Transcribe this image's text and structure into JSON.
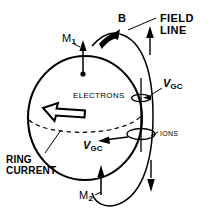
{
  "figure": {
    "background_color": "#ffffff",
    "line_color": "#000000",
    "width": 209,
    "height": 217
  },
  "labels": {
    "field_line_line1": "FIELD",
    "field_line_line2": "LINE",
    "magnetic_field": "B",
    "mirror_point_top_symbol": "M",
    "mirror_point_top_sub": "1",
    "mirror_point_bottom_symbol": "M",
    "mirror_point_bottom_sub": "2",
    "drift_velocity_symbol": "V",
    "drift_velocity_sub": "GC",
    "electrons": "ELECTRONS",
    "ions": "IONS",
    "ring_current_line1": "RING",
    "ring_current_line2": "CURRENT"
  },
  "elements": {
    "sphere": {
      "center_x": 85,
      "center_y": 117,
      "radius_x": 57,
      "radius_y": 62
    },
    "equator_dashed": true,
    "ring_current_arrow_direction": "left",
    "field_line_arrows": 3,
    "gyration_circles": 2
  }
}
